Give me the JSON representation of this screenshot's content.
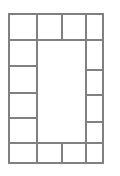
{
  "figure": {
    "canvas": {
      "width": 120,
      "height": 176,
      "background": "#ffffff"
    }
  },
  "style": {
    "stroke_color": "#808080",
    "stroke_width": 1.4,
    "fill_color": "#ffffff",
    "line_cap": "square"
  },
  "chart_data": {
    "type": "diagram",
    "grid": true,
    "outer_rect": {
      "x": 9,
      "y": 14,
      "width": 94,
      "height": 149
    },
    "center_void": {
      "x": 37,
      "y": 40,
      "width": 49,
      "height": 103
    },
    "top_row": {
      "y_top": 14,
      "y_bottom": 40,
      "dividers_x": [
        37,
        62,
        86
      ],
      "cell_count": 4
    },
    "bottom_row": {
      "y_top": 143,
      "y_bottom": 163,
      "dividers_x": [
        37,
        62,
        86
      ],
      "cell_count": 4
    },
    "left_column": {
      "x_left": 9,
      "x_right": 37,
      "dividers_y": [
        40,
        66,
        93,
        118,
        143
      ],
      "cell_count": 6
    },
    "right_column": {
      "x_left": 86,
      "x_right": 103,
      "dividers_y": [
        40,
        70,
        95,
        122,
        143
      ],
      "cell_count": 6
    },
    "cells": [
      {
        "id": "top-1",
        "x": 9,
        "y": 14,
        "w": 28,
        "h": 26,
        "label": ""
      },
      {
        "id": "top-2",
        "x": 37,
        "y": 14,
        "w": 25,
        "h": 26,
        "label": ""
      },
      {
        "id": "top-3",
        "x": 62,
        "y": 14,
        "w": 24,
        "h": 26,
        "label": ""
      },
      {
        "id": "top-4",
        "x": 86,
        "y": 14,
        "w": 17,
        "h": 26,
        "label": ""
      },
      {
        "id": "left-1",
        "x": 9,
        "y": 40,
        "w": 28,
        "h": 26,
        "label": ""
      },
      {
        "id": "left-2",
        "x": 9,
        "y": 66,
        "w": 28,
        "h": 27,
        "label": ""
      },
      {
        "id": "left-3",
        "x": 9,
        "y": 93,
        "w": 28,
        "h": 25,
        "label": ""
      },
      {
        "id": "left-4",
        "x": 9,
        "y": 118,
        "w": 28,
        "h": 25,
        "label": ""
      },
      {
        "id": "right-1",
        "x": 86,
        "y": 40,
        "w": 17,
        "h": 30,
        "label": ""
      },
      {
        "id": "right-2",
        "x": 86,
        "y": 70,
        "w": 17,
        "h": 25,
        "label": ""
      },
      {
        "id": "right-3",
        "x": 86,
        "y": 95,
        "w": 17,
        "h": 27,
        "label": ""
      },
      {
        "id": "right-4",
        "x": 86,
        "y": 122,
        "w": 17,
        "h": 21,
        "label": ""
      },
      {
        "id": "bottom-1",
        "x": 9,
        "y": 143,
        "w": 28,
        "h": 20,
        "label": ""
      },
      {
        "id": "bottom-2",
        "x": 37,
        "y": 143,
        "w": 25,
        "h": 20,
        "label": ""
      },
      {
        "id": "bottom-3",
        "x": 62,
        "y": 143,
        "w": 24,
        "h": 20,
        "label": ""
      },
      {
        "id": "bottom-4",
        "x": 86,
        "y": 143,
        "w": 17,
        "h": 20,
        "label": ""
      },
      {
        "id": "center",
        "x": 37,
        "y": 40,
        "w": 49,
        "h": 103,
        "label": ""
      }
    ],
    "segments": [
      {
        "id": "outer-border",
        "kind": "rect",
        "x": 9,
        "y": 14,
        "w": 94,
        "h": 149
      },
      {
        "id": "v-top-a",
        "kind": "line",
        "x1": 37,
        "y1": 14,
        "x2": 37,
        "y2": 40
      },
      {
        "id": "v-top-b",
        "kind": "line",
        "x1": 62,
        "y1": 14,
        "x2": 62,
        "y2": 40
      },
      {
        "id": "v-top-c",
        "kind": "line",
        "x1": 86,
        "y1": 14,
        "x2": 86,
        "y2": 40
      },
      {
        "id": "v-bot-a",
        "kind": "line",
        "x1": 37,
        "y1": 143,
        "x2": 37,
        "y2": 163
      },
      {
        "id": "v-bot-b",
        "kind": "line",
        "x1": 62,
        "y1": 143,
        "x2": 62,
        "y2": 163
      },
      {
        "id": "v-bot-c",
        "kind": "line",
        "x1": 86,
        "y1": 143,
        "x2": 86,
        "y2": 163
      },
      {
        "id": "v-left-col",
        "kind": "line",
        "x1": 37,
        "y1": 40,
        "x2": 37,
        "y2": 143
      },
      {
        "id": "v-right-col",
        "kind": "line",
        "x1": 86,
        "y1": 40,
        "x2": 86,
        "y2": 143
      },
      {
        "id": "h-top",
        "kind": "line",
        "x1": 9,
        "y1": 40,
        "x2": 103,
        "y2": 40
      },
      {
        "id": "h-bottom",
        "kind": "line",
        "x1": 9,
        "y1": 143,
        "x2": 103,
        "y2": 143
      },
      {
        "id": "h-left-1",
        "kind": "line",
        "x1": 9,
        "y1": 66,
        "x2": 37,
        "y2": 66
      },
      {
        "id": "h-left-2",
        "kind": "line",
        "x1": 9,
        "y1": 93,
        "x2": 37,
        "y2": 93
      },
      {
        "id": "h-left-3",
        "kind": "line",
        "x1": 9,
        "y1": 118,
        "x2": 37,
        "y2": 118
      },
      {
        "id": "h-right-1",
        "kind": "line",
        "x1": 86,
        "y1": 70,
        "x2": 103,
        "y2": 70
      },
      {
        "id": "h-right-2",
        "kind": "line",
        "x1": 86,
        "y1": 95,
        "x2": 103,
        "y2": 95
      },
      {
        "id": "h-right-3",
        "kind": "line",
        "x1": 86,
        "y1": 122,
        "x2": 103,
        "y2": 122
      }
    ]
  }
}
